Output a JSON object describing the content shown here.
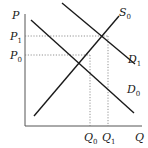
{
  "diagram": {
    "type": "supply-demand",
    "axes": {
      "y_label": "P",
      "x_label": "Q"
    },
    "price_levels": [
      {
        "name": "P",
        "sub": "1",
        "y": 36
      },
      {
        "name": "P",
        "sub": "0",
        "y": 55
      }
    ],
    "quantity_levels": [
      {
        "name": "Q",
        "sub": "0",
        "x": 90
      },
      {
        "name": "Q",
        "sub": "1",
        "x": 108
      }
    ],
    "curves": [
      {
        "name": "S",
        "sub": "0",
        "kind": "supply"
      },
      {
        "name": "D",
        "sub": "1",
        "kind": "demand"
      },
      {
        "name": "D",
        "sub": "0",
        "kind": "demand"
      }
    ],
    "colors": {
      "line": "#1a1a1a",
      "axis": "#555555",
      "guide": "#777777"
    }
  }
}
